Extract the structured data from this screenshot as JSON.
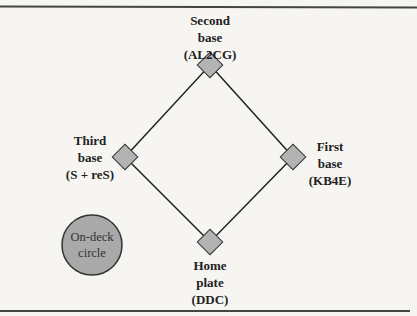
{
  "diagram": {
    "type": "baseball-diamond",
    "colors": {
      "base_fill": "#b3b3b3",
      "circle_fill": "#a9a9a9",
      "line": "#222222",
      "background": "#f6f5f2"
    },
    "bases": {
      "second": {
        "line1": "Second",
        "line2": "base",
        "line3": "(AL2CG)"
      },
      "third": {
        "line1": "Third",
        "line2": "base",
        "line3": "(S + reS)"
      },
      "first": {
        "line1": "First",
        "line2": "base",
        "line3": "(KB4E)"
      },
      "home": {
        "line1": "Home",
        "line2": "plate",
        "line3": "(DDC)"
      }
    },
    "on_deck": {
      "line1": "On-deck",
      "line2": "circle"
    }
  }
}
